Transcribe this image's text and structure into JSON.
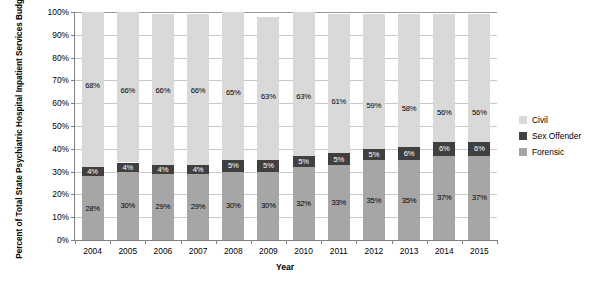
{
  "chart_data": {
    "type": "bar",
    "subtype": "100% stacked bar",
    "title": "",
    "xlabel": "Year",
    "ylabel": "Percent of Total State Psychiatric Hospital Inpatient Services Budget",
    "categories": [
      "2004",
      "2005",
      "2006",
      "2007",
      "2008",
      "2009",
      "2010",
      "2011",
      "2012",
      "2013",
      "2014",
      "2015"
    ],
    "ylim": [
      0,
      100
    ],
    "yticks": [
      "0%",
      "10%",
      "20%",
      "30%",
      "40%",
      "50%",
      "60%",
      "70%",
      "80%",
      "90%",
      "100%"
    ],
    "ytick_values": [
      0,
      10,
      20,
      30,
      40,
      50,
      60,
      70,
      80,
      90,
      100
    ],
    "grid": true,
    "legend_position": "right",
    "stack_order_bottom_to_top": [
      "Forensic",
      "Sex Offender",
      "Civil"
    ],
    "series": [
      {
        "name": "Forensic",
        "color": "#a6a6a6",
        "values": [
          28,
          30,
          29,
          29,
          30,
          30,
          32,
          33,
          35,
          35,
          37,
          37
        ],
        "labels": [
          "28%",
          "30%",
          "29%",
          "29%",
          "30%",
          "30%",
          "32%",
          "33%",
          "35%",
          "35%",
          "37%",
          "37%"
        ]
      },
      {
        "name": "Sex Offender",
        "color": "#404040",
        "values": [
          4,
          4,
          4,
          4,
          5,
          5,
          5,
          5,
          5,
          6,
          6,
          6
        ],
        "labels": [
          "4%",
          "4%",
          "4%",
          "4%",
          "5%",
          "5%",
          "5%",
          "5%",
          "5%",
          "6%",
          "6%",
          "6%"
        ]
      },
      {
        "name": "Civil",
        "color": "#d9d9d9",
        "values": [
          68,
          66,
          66,
          66,
          65,
          63,
          63,
          61,
          59,
          58,
          56,
          56
        ],
        "labels": [
          "68%",
          "66%",
          "66%",
          "66%",
          "65%",
          "63%",
          "63%",
          "61%",
          "59%",
          "58%",
          "56%",
          "56%"
        ]
      }
    ]
  },
  "legend": {
    "items": [
      {
        "label": "Civil",
        "color": "#d9d9d9"
      },
      {
        "label": "Sex Offender",
        "color": "#404040"
      },
      {
        "label": "Forensic",
        "color": "#a6a6a6"
      }
    ]
  }
}
